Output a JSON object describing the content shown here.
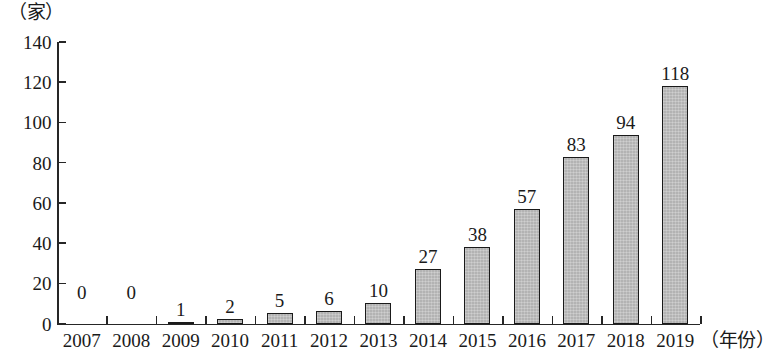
{
  "chart_data": {
    "type": "bar",
    "title": "",
    "subtitle": "",
    "xlabel": "（年份）",
    "ylabel": "（家）",
    "categories": [
      "2007",
      "2008",
      "2009",
      "2010",
      "2011",
      "2012",
      "2013",
      "2014",
      "2015",
      "2016",
      "2017",
      "2018",
      "2019"
    ],
    "values": [
      0,
      0,
      1,
      2,
      5,
      6,
      10,
      27,
      38,
      57,
      83,
      94,
      118
    ],
    "data_labels": [
      "0",
      "0",
      "1",
      "2",
      "5",
      "6",
      "10",
      "27",
      "38",
      "57",
      "83",
      "94",
      "118"
    ],
    "ylim": [
      0,
      140
    ],
    "yticks": [
      0,
      20,
      40,
      60,
      80,
      100,
      120,
      140
    ],
    "ytick_labels": [
      "0",
      "20",
      "40",
      "60",
      "80",
      "100",
      "120",
      "140"
    ],
    "grid": false,
    "legend": null,
    "series": [
      {
        "name": "",
        "values": [
          0,
          0,
          1,
          2,
          5,
          6,
          10,
          27,
          38,
          57,
          83,
          94,
          118
        ],
        "color": "#b3b3b3",
        "border_color": "#1a1a1a"
      }
    ]
  }
}
